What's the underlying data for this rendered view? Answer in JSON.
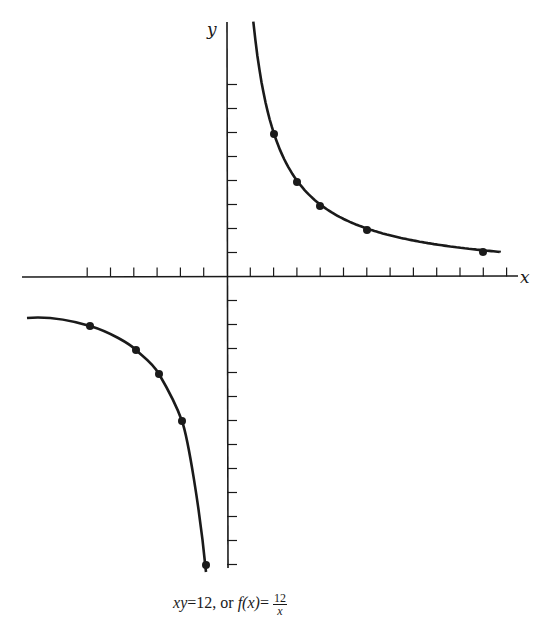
{
  "chart_data": {
    "type": "line",
    "title": "",
    "caption": "xy = 12, or f(x) = 12/x",
    "xlabel": "x",
    "ylabel": "y",
    "function": "f(x) = 12/x",
    "xlim": [
      -9,
      13
    ],
    "ylim": [
      -12,
      11
    ],
    "x_ticks": [
      -6,
      -5,
      -4,
      -3,
      -2,
      -1,
      1,
      2,
      3,
      4,
      5,
      6,
      7,
      8,
      9,
      10,
      11,
      12
    ],
    "y_ticks": [
      -12,
      -11,
      -10,
      -9,
      -8,
      -7,
      -6,
      -5,
      -4,
      -3,
      -2,
      -1,
      1,
      2,
      3,
      4,
      5,
      6,
      7,
      8
    ],
    "grid": false,
    "tick_labels_shown": false,
    "series": [
      {
        "name": "branch x>0",
        "points": [
          [
            2,
            6
          ],
          [
            3,
            4
          ],
          [
            4,
            3
          ],
          [
            6,
            2
          ],
          [
            12,
            1
          ]
        ]
      },
      {
        "name": "branch x<0",
        "points": [
          [
            -6,
            -2
          ],
          [
            -4,
            -3
          ],
          [
            -3,
            -4
          ],
          [
            -2,
            -6
          ],
          [
            -1,
            -12
          ]
        ]
      }
    ]
  },
  "labels": {
    "x_axis": "x",
    "y_axis": "y",
    "caption_lhs": "xy",
    "caption_eq1": "=12, or ",
    "caption_f": "f",
    "caption_fx": "(x)",
    "caption_eq2": "=",
    "caption_num": "12",
    "caption_den": "x"
  },
  "style": {
    "ink": "#1a1a1a",
    "background": "#ffffff"
  }
}
